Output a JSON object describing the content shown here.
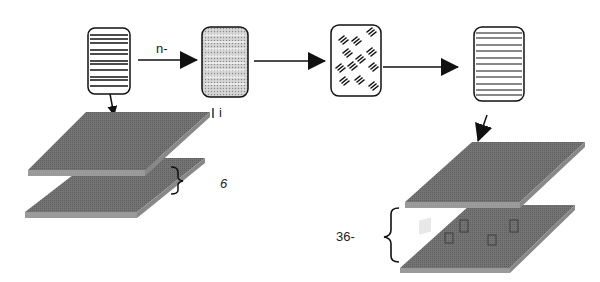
{
  "diagram": {
    "blocks": [
      {
        "id": "block-1",
        "pattern": "horizontal-stripes-irregular"
      },
      {
        "id": "block-2",
        "pattern": "dotted-horizontal-stripes"
      },
      {
        "id": "block-3",
        "pattern": "diagonal-dash-groups"
      },
      {
        "id": "block-4",
        "pattern": "horizontal-stripes-regular"
      }
    ],
    "labels": {
      "arrow_label": "n-",
      "left_top_label": "i",
      "left_gap_label": "6",
      "right_gap_label": "36-"
    },
    "left_stack": {
      "plates": 2
    },
    "right_stack": {
      "plates": 2
    },
    "colors": {
      "plate_top": "#6e6e6e",
      "plate_edge": "#9a9a9a",
      "line": "#111111"
    }
  }
}
